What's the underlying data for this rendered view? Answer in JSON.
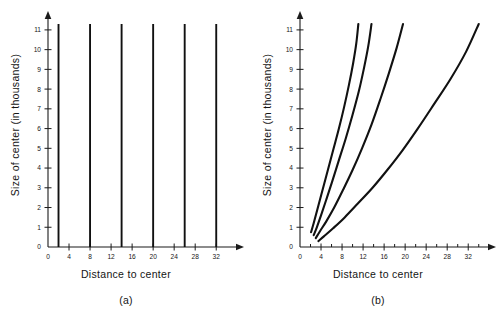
{
  "figure": {
    "panels": [
      {
        "caption": "(a)",
        "xlabel": "Distance to center",
        "ylabel": "Size of center (in thousands)"
      },
      {
        "caption": "(b)",
        "xlabel": "Distance to center",
        "ylabel": "Size of center (in thousands)"
      }
    ]
  },
  "chart_data": [
    {
      "type": "bar",
      "panel": "(a)",
      "title": "",
      "xlabel": "Distance to center",
      "ylabel": "Size of center (in thousands)",
      "xlim": [
        0,
        35
      ],
      "ylim": [
        0,
        11.4
      ],
      "grid": false,
      "legend": "none",
      "xticks": [
        0,
        4,
        8,
        12,
        16,
        20,
        24,
        28,
        32
      ],
      "xtick_labels": [
        "0",
        "4",
        "8",
        "12",
        "16",
        "20",
        "24",
        "28",
        "32"
      ],
      "yticks": [
        0,
        1,
        2,
        3,
        4,
        5,
        6,
        7,
        8,
        9,
        10,
        11
      ],
      "ytick_labels": [
        "0",
        "1",
        "2",
        "3",
        "4",
        "5",
        "6",
        "7",
        "8",
        "9",
        "10",
        "11"
      ],
      "categories": [
        2,
        8,
        14,
        20,
        26,
        32
      ],
      "values": [
        11.3,
        11.3,
        11.3,
        11.3,
        11.3,
        11.3
      ],
      "note": "Six vertical spikes of equal full height at distances 2, 8, 14, 20, 26, 32"
    },
    {
      "type": "line",
      "panel": "(b)",
      "title": "",
      "xlabel": "Distance to center",
      "ylabel": "Size of center (in thousands)",
      "xlim": [
        0,
        35
      ],
      "ylim": [
        0,
        11.4
      ],
      "grid": false,
      "legend": "none",
      "xticks": [
        0,
        4,
        8,
        12,
        16,
        20,
        24,
        28,
        32
      ],
      "xtick_labels": [
        "0",
        "4",
        "8",
        "12",
        "16",
        "20",
        "24",
        "28",
        "32"
      ],
      "xminor_ticks": [
        2,
        6,
        10,
        14,
        18,
        22,
        26,
        30,
        34
      ],
      "yticks": [
        0,
        1,
        2,
        3,
        4,
        5,
        6,
        7,
        8,
        9,
        10,
        11
      ],
      "ytick_labels": [
        "0",
        "1",
        "2",
        "3",
        "4",
        "5",
        "6",
        "7",
        "8",
        "9",
        "10",
        "11"
      ],
      "series": [
        {
          "name": "curve-1",
          "x": [
            2.1,
            2.6,
            3.3,
            4.2,
            5.2,
            6.3,
            7.4,
            8.4,
            9.3,
            10.1,
            10.7,
            11.1
          ],
          "y": [
            0.75,
            1.2,
            1.9,
            2.8,
            3.8,
            4.9,
            6.0,
            7.1,
            8.2,
            9.3,
            10.3,
            11.3
          ]
        },
        {
          "name": "curve-2",
          "x": [
            2.6,
            3.2,
            4.0,
            5.0,
            6.1,
            7.4,
            8.7,
            10.0,
            11.2,
            12.2,
            13.0,
            13.6
          ],
          "y": [
            0.6,
            1.0,
            1.6,
            2.4,
            3.3,
            4.4,
            5.5,
            6.7,
            7.9,
            9.1,
            10.2,
            11.3
          ]
        },
        {
          "name": "curve-3",
          "x": [
            3.0,
            3.8,
            5.0,
            6.5,
            8.2,
            10.0,
            11.8,
            13.6,
            15.3,
            16.9,
            18.4,
            19.6
          ],
          "y": [
            0.45,
            0.8,
            1.3,
            2.0,
            2.9,
            3.9,
            5.0,
            6.2,
            7.5,
            8.8,
            10.1,
            11.3
          ]
        },
        {
          "name": "curve-4",
          "x": [
            3.5,
            4.6,
            6.3,
            8.5,
            11.0,
            13.8,
            16.6,
            19.5,
            22.4,
            25.4,
            28.6,
            31.6,
            34.0
          ],
          "y": [
            0.3,
            0.55,
            0.95,
            1.5,
            2.2,
            3.0,
            3.9,
            4.9,
            6.0,
            7.2,
            8.5,
            9.9,
            11.3
          ]
        }
      ],
      "note": "Four monotonically increasing convex curves rising from near the origin to the top of the y-range"
    }
  ]
}
